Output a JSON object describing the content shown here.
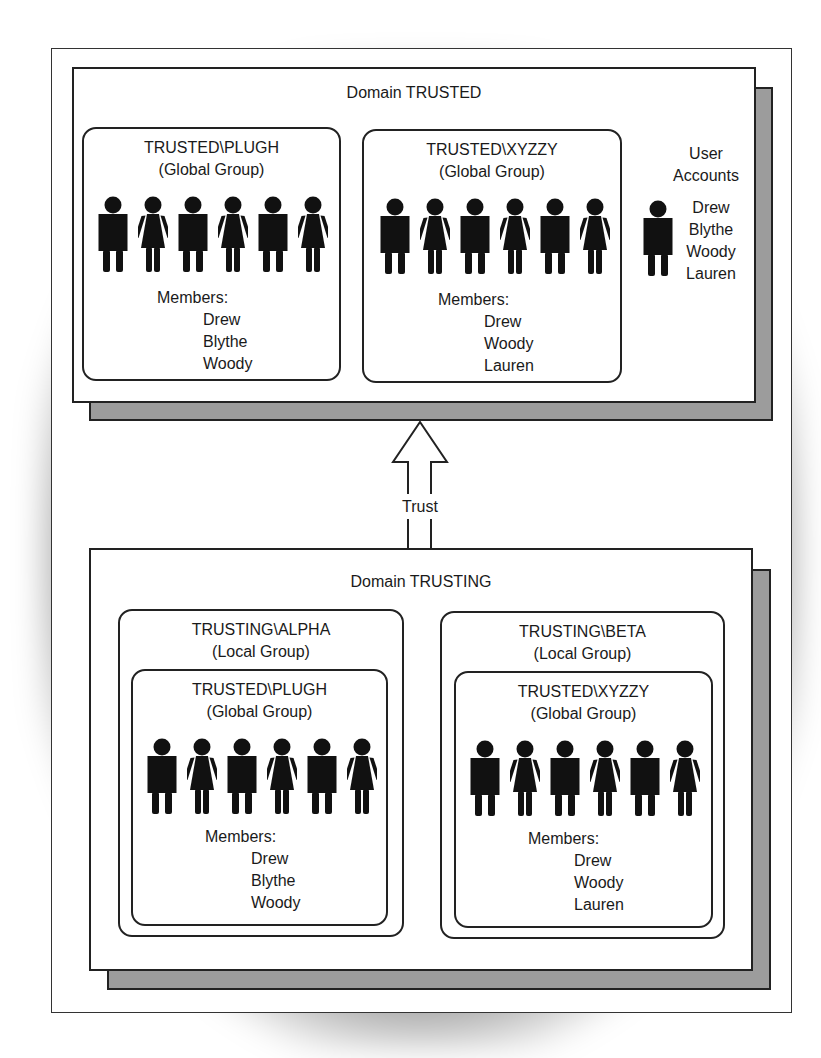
{
  "diagram": {
    "trust_label": "Trust",
    "domains": [
      {
        "title": "Domain TRUSTED",
        "groups": [
          {
            "name": "TRUSTED\\PLUGH",
            "type": "(Global Group)",
            "members_label": "Members:",
            "members": [
              "Drew",
              "Blythe",
              "Woody"
            ],
            "figures": [
              "male",
              "female",
              "male",
              "female",
              "male",
              "female"
            ]
          },
          {
            "name": "TRUSTED\\XYZZY",
            "type": "(Global Group)",
            "members_label": "Members:",
            "members": [
              "Drew",
              "Woody",
              "Lauren"
            ],
            "figures": [
              "male",
              "female",
              "male",
              "female",
              "male",
              "female"
            ]
          }
        ],
        "user_accounts": {
          "title_line1": "User",
          "title_line2": "Accounts",
          "users": [
            "Drew",
            "Blythe",
            "Woody",
            "Lauren"
          ]
        }
      },
      {
        "title": "Domain TRUSTING",
        "local_groups": [
          {
            "name": "TRUSTING\\ALPHA",
            "type": "(Local Group)",
            "nested": {
              "name": "TRUSTED\\PLUGH",
              "type": "(Global Group)",
              "members_label": "Members:",
              "members": [
                "Drew",
                "Blythe",
                "Woody"
              ]
            }
          },
          {
            "name": "TRUSTING\\BETA",
            "type": "(Local Group)",
            "nested": {
              "name": "TRUSTED\\XYZZY",
              "type": "(Global Group)",
              "members_label": "Members:",
              "members": [
                "Drew",
                "Woody",
                "Lauren"
              ]
            }
          }
        ]
      }
    ],
    "colors": {
      "shadow_gray": "#9c9c9c",
      "line": "#222222",
      "figure": "#111111"
    }
  }
}
